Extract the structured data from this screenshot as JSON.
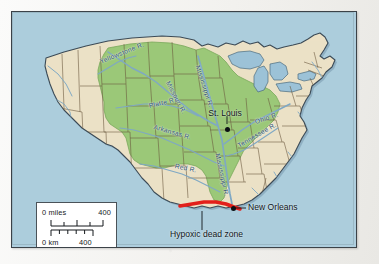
{
  "map": {
    "title": "Mississippi River Basin and Gulf of Mexico Hypoxic Dead Zone",
    "colors": {
      "ocean": "#aecede",
      "land": "#ece1c6",
      "watershed": "#9cc878",
      "river": "#7fa8c4",
      "state_border": "#6b5a3e",
      "coastline": "#3c4b57",
      "hypoxic_red": "#e2201b",
      "frame": "#3b4248",
      "label_river": "#2a4f6b",
      "label_city": "#10161a",
      "scale_box": "#ffffff"
    },
    "rivers": [
      {
        "name": "Yellowstone R.",
        "x": 88,
        "y": 48,
        "rotate": -22
      },
      {
        "name": "Missouri R.",
        "x": 156,
        "y": 68,
        "rotate": 62
      },
      {
        "name": "Mississippi R.",
        "x": 186,
        "y": 52,
        "rotate": 72
      },
      {
        "name": "Platte R.",
        "x": 137,
        "y": 92,
        "rotate": -13
      },
      {
        "name": "Arkansas R.",
        "x": 142,
        "y": 113,
        "rotate": 16
      },
      {
        "name": "Red R.",
        "x": 163,
        "y": 152,
        "rotate": 12
      },
      {
        "name": "Ohio R.",
        "x": 243,
        "y": 108,
        "rotate": -18
      },
      {
        "name": "Tennessee R.",
        "x": 226,
        "y": 132,
        "rotate": -30
      },
      {
        "name": "Mississippi R.",
        "x": 206,
        "y": 140,
        "rotate": 78
      }
    ],
    "cities": [
      {
        "name": "St.\nLouis",
        "dot_x": 215,
        "dot_y": 117,
        "label_x": 212,
        "label_y": 100
      },
      {
        "name": "New\nOrleans",
        "dot_x": 221,
        "dot_y": 196,
        "label_x": 236,
        "label_y": 194
      }
    ],
    "annotations": [
      {
        "name": "Hypoxic\ndead zone",
        "x": 190,
        "y": 222
      }
    ],
    "scale": {
      "miles_left": "0 miles",
      "miles_right": "400",
      "km_left": "0 km",
      "km_right": "400",
      "miles_divisions": 4,
      "km_divisions": 5
    }
  }
}
